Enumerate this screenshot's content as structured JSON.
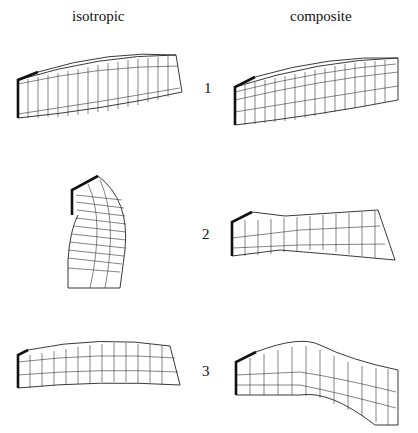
{
  "figure": {
    "columns": [
      {
        "label": "isotropic"
      },
      {
        "label": "composite"
      }
    ],
    "modes": [
      {
        "number": "1"
      },
      {
        "number": "2"
      },
      {
        "number": "3"
      }
    ]
  }
}
